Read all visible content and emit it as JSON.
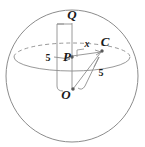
{
  "figure": {
    "labels": {
      "top_point": "Q",
      "center_point": "O",
      "axis_point": "P",
      "surface_point": "C",
      "segment_pc": "x",
      "radius_left": "5",
      "radius_right": "5"
    },
    "colors": {
      "sphere_outline": "#8c8c8c",
      "equator": "#8c8c8c",
      "construction_line": "#8f8f8f",
      "label_text": "#1a1a1a",
      "background": "#ffffff"
    },
    "geometry": {
      "sphere_center_x": 72,
      "sphere_center_y": 76,
      "sphere_radius_x": 66,
      "sphere_radius_y": 66,
      "equator_center_x": 72,
      "equator_center_y": 57,
      "equator_radius_x": 58,
      "equator_radius_y": 14,
      "point_q_x": 72,
      "point_q_y": 23,
      "point_o_x": 72,
      "point_o_y": 90,
      "point_p_x": 72,
      "point_p_y": 56,
      "point_c_x": 103,
      "point_c_y": 50
    }
  }
}
